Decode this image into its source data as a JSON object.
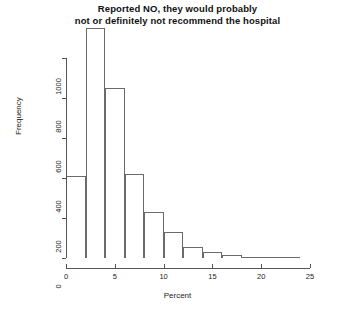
{
  "chart_data": {
    "type": "bar",
    "title": "Reported NO, they would probably not or definitely not recommend the hospital",
    "title_lines": [
      "Reported NO, they would probably",
      "not or definitely not recommend the hospital"
    ],
    "xlabel": "Percent",
    "ylabel": "Frequency",
    "xlim": [
      0,
      25
    ],
    "ylim": [
      0,
      1150
    ],
    "grid": false,
    "legend": null,
    "bin_width": 2,
    "xticks": [
      0,
      5,
      10,
      15,
      20,
      25
    ],
    "xtick_labels": [
      "0",
      "5",
      "10",
      "15",
      "20",
      "25"
    ],
    "yticks": [
      0,
      200,
      400,
      600,
      800,
      1000
    ],
    "ytick_labels": [
      "0",
      "200",
      "400",
      "600",
      "800",
      "1000"
    ],
    "bin_starts": [
      0,
      2,
      4,
      6,
      8,
      10,
      12,
      14,
      16,
      18,
      20,
      22
    ],
    "bin_ends": [
      2,
      4,
      6,
      8,
      10,
      12,
      14,
      16,
      18,
      20,
      22,
      24
    ],
    "categories": [
      "0-2",
      "2-4",
      "4-6",
      "6-8",
      "8-10",
      "10-12",
      "12-14",
      "14-16",
      "16-18",
      "18-20",
      "20-22",
      "22-24"
    ],
    "values": [
      410,
      1150,
      850,
      420,
      230,
      130,
      55,
      30,
      14,
      7,
      4,
      2
    ],
    "colors": {
      "bar_fill": "#ffffff",
      "bar_border": "#6a6a6a",
      "axis": "#555555",
      "text": "#1a1a1a"
    }
  }
}
